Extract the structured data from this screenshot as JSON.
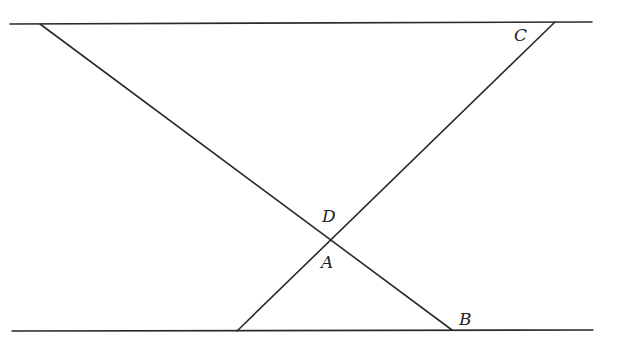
{
  "diagram": {
    "type": "geometry",
    "stroke_color": "#2a2a2a",
    "lines": [
      {
        "id": "top-parallel",
        "x1": 10,
        "y1": 24,
        "x2": 592,
        "y2": 22
      },
      {
        "id": "bottom-parallel",
        "x1": 12,
        "y1": 331,
        "x2": 593,
        "y2": 330
      },
      {
        "id": "transversal-left-to-B",
        "x1": 40,
        "y1": 24,
        "x2": 452,
        "y2": 330
      },
      {
        "id": "transversal-C-to-bottom",
        "x1": 555,
        "y1": 22,
        "x2": 237,
        "y2": 331
      }
    ],
    "labels": [
      {
        "id": "C",
        "text": "C",
        "x": 514,
        "y": 41
      },
      {
        "id": "D",
        "text": "D",
        "x": 322,
        "y": 222
      },
      {
        "id": "A",
        "text": "A",
        "x": 321,
        "y": 268
      },
      {
        "id": "B",
        "text": "B",
        "x": 459,
        "y": 325
      }
    ]
  }
}
